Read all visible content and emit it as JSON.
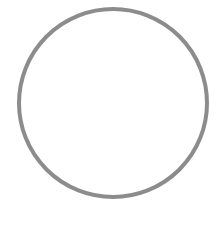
{
  "canvas": {
    "width": 219,
    "height": 228,
    "background": "#ffffff"
  },
  "shape": {
    "type": "circle-outline",
    "icon": "empty-circle-icon",
    "center_x": 113,
    "center_y": 103,
    "radius": 94,
    "stroke_width": 4,
    "stroke_color": "#8c8c8c",
    "fill": "none"
  }
}
